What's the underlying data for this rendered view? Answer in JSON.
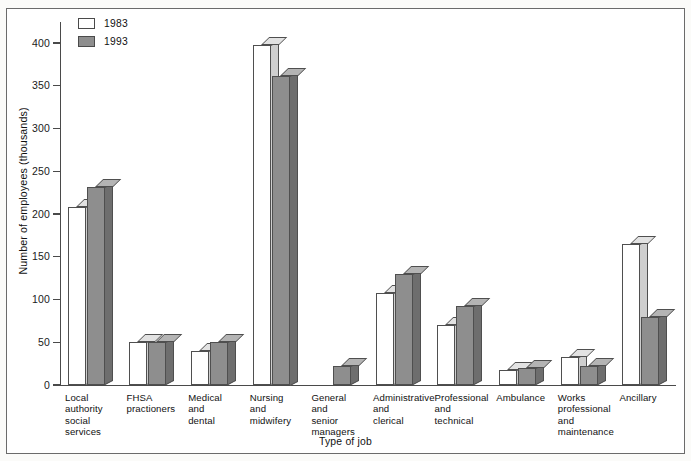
{
  "chart_data": {
    "type": "bar",
    "title": "",
    "xlabel": "Type of job",
    "ylabel": "Number of employees (thousands)",
    "ylim": [
      0,
      420
    ],
    "yticks": [
      0,
      50,
      100,
      150,
      200,
      250,
      300,
      350,
      400
    ],
    "ytick_labels": [
      "0",
      "50",
      "100",
      "150",
      "200",
      "250",
      "300",
      "350",
      "400"
    ],
    "grid": false,
    "legend_position": "top-left",
    "style": "3d-bar",
    "categories": [
      "Local authority social services",
      "FHSA practioners",
      "Medical and dental",
      "Nursing and midwifery",
      "General and senior managers",
      "Administrative and clerical",
      "Professional and technical",
      "Ambulance",
      "Works professional and maintenance",
      "Ancillary"
    ],
    "category_lines": [
      [
        "Local",
        "authority",
        "social",
        "services"
      ],
      [
        "FHSA",
        "practioners"
      ],
      [
        "Medical",
        "and",
        "dental"
      ],
      [
        "Nursing",
        "and",
        "midwifery"
      ],
      [
        "General",
        "and",
        "senior",
        "managers"
      ],
      [
        "Administrative",
        "and",
        "clerical"
      ],
      [
        "Professional",
        "and",
        "technical"
      ],
      [
        "Ambulance"
      ],
      [
        "Works",
        "professional",
        "and",
        "maintenance"
      ],
      [
        "Ancillary"
      ]
    ],
    "series": [
      {
        "name": "1983",
        "color": "#ffffff",
        "values": [
          208,
          50,
          40,
          398,
          0,
          108,
          70,
          18,
          33,
          165
        ]
      },
      {
        "name": "1993",
        "color": "#8e8e8e",
        "values": [
          232,
          50,
          50,
          362,
          22,
          130,
          92,
          20,
          22,
          80
        ]
      }
    ]
  },
  "legend": {
    "items": [
      {
        "label": "1983",
        "swatch": "white"
      },
      {
        "label": "1993",
        "swatch": "gray"
      }
    ]
  },
  "axes": {
    "y_title": "Number of employees (thousands)",
    "x_title": "Type of job"
  },
  "colors": {
    "bar_1983_face": "#ffffff",
    "bar_1983_side": "#cfcfcf",
    "bar_1983_top": "#e2e2e2",
    "bar_1993_face": "#8e8e8e",
    "bar_1993_side": "#6e6e6e",
    "bar_1993_top": "#b4b4b4",
    "axis": "#4a4a4a",
    "frame": "#6b6b6b",
    "text": "#111111"
  }
}
